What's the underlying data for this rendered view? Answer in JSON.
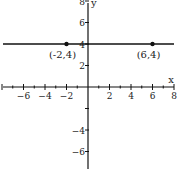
{
  "chart_data": {
    "type": "line",
    "title": "",
    "xlabel": "x",
    "ylabel": "y",
    "xlim": [
      -8,
      8
    ],
    "ylim": [
      -8,
      8
    ],
    "grid": false,
    "x_ticks": [
      -6,
      -4,
      -2,
      2,
      4,
      6,
      8
    ],
    "y_ticks": [
      8,
      6,
      4,
      2,
      -4,
      -6,
      -8
    ],
    "series": [
      {
        "name": "y = 4",
        "type": "horizontal-line",
        "y": 4,
        "x_range": [
          -8,
          8
        ]
      }
    ],
    "points": [
      {
        "x": -2,
        "y": 4,
        "label": "(-2,4)"
      },
      {
        "x": 6,
        "y": 4,
        "label": "(6,4)"
      }
    ],
    "colors": {
      "line": "#111111",
      "axis": "#111111",
      "point": "#111111"
    }
  }
}
